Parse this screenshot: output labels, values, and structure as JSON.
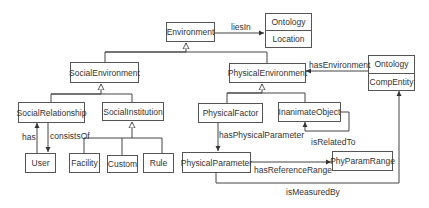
{
  "diagram": {
    "type": "UML class diagram",
    "nodes": {
      "environment": "Environment",
      "ontology_location": {
        "stereotype": "Ontology",
        "name": "Location"
      },
      "social_environment": "SocialEnvironment",
      "physical_environment": "PhysicalEnvironment",
      "ontology_compentity": {
        "stereotype": "Ontology",
        "name": "CompEntity"
      },
      "social_relationship": "SocialRelationship",
      "social_institution": "SocialInstitution",
      "physical_factor": "PhysicalFactor",
      "inanimate_object": "InanimateObject",
      "user": "User",
      "facility": "Facility",
      "custom": "Custom",
      "rule": "Rule",
      "physical_parameter": "PhysicalParameter",
      "phy_param_range": "PhyParamRange"
    },
    "edges": {
      "lies_in": "liesIn",
      "has_environment": "hasEnvironment",
      "has": "has",
      "consists_of": "consistsOf",
      "has_physical_parameter": "hasPhysicalParameter",
      "is_related_to": "isRelatedTo",
      "has_reference_range": "hasReferenceRange",
      "is_measured_by": "isMeasuredBy"
    },
    "relations": [
      {
        "from": "Environment",
        "to": "Location",
        "label": "liesIn",
        "kind": "association"
      },
      {
        "from": "SocialEnvironment",
        "to": "Environment",
        "kind": "generalization"
      },
      {
        "from": "PhysicalEnvironment",
        "to": "Environment",
        "kind": "generalization"
      },
      {
        "from": "CompEntity",
        "to": "PhysicalEnvironment",
        "label": "hasEnvironment",
        "kind": "association"
      },
      {
        "from": "SocialRelationship",
        "to": "SocialEnvironment",
        "kind": "generalization"
      },
      {
        "from": "SocialInstitution",
        "to": "SocialEnvironment",
        "kind": "generalization"
      },
      {
        "from": "User",
        "to": "SocialRelationship",
        "label": "has",
        "kind": "association"
      },
      {
        "from": "SocialRelationship",
        "to": "User",
        "label": "consistsOf",
        "kind": "association"
      },
      {
        "from": "Facility",
        "to": "SocialInstitution",
        "kind": "generalization"
      },
      {
        "from": "Custom",
        "to": "SocialInstitution",
        "kind": "generalization"
      },
      {
        "from": "Rule",
        "to": "SocialInstitution",
        "kind": "generalization"
      },
      {
        "from": "PhysicalFactor",
        "to": "PhysicalEnvironment",
        "kind": "generalization"
      },
      {
        "from": "InanimateObject",
        "to": "PhysicalEnvironment",
        "kind": "generalization"
      },
      {
        "from": "PhysicalFactor",
        "to": "PhysicalParameter",
        "label": "hasPhysicalParameter",
        "kind": "association"
      },
      {
        "from": "InanimateObject",
        "to": "InanimateObject",
        "label": "isRelatedTo",
        "kind": "association"
      },
      {
        "from": "PhysicalParameter",
        "to": "PhyParamRange",
        "label": "hasReferenceRange",
        "kind": "association"
      },
      {
        "from": "PhysicalParameter",
        "to": "CompEntity",
        "label": "isMeasuredBy",
        "kind": "association"
      }
    ]
  }
}
